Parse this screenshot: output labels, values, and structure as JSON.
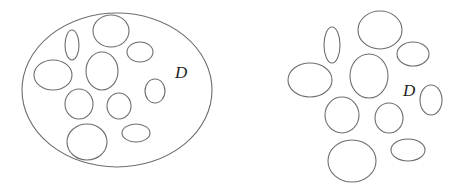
{
  "diagram": {
    "stroke_color": "#6e6e6e",
    "label_color": "#222222",
    "panels": [
      {
        "name": "left-panel",
        "description": "Domain D with holes, bounded by outer ellipse",
        "label": {
          "text": "D",
          "x": 175,
          "y": 78
        },
        "boundary": {
          "cx": 117,
          "cy": 90,
          "rx": 95,
          "ry": 77
        },
        "holes": [
          {
            "cx": 72,
            "cy": 45,
            "rx": 7,
            "ry": 15
          },
          {
            "cx": 111,
            "cy": 31,
            "rx": 18,
            "ry": 16
          },
          {
            "cx": 140,
            "cy": 52,
            "rx": 13,
            "ry": 10
          },
          {
            "cx": 53,
            "cy": 75,
            "rx": 19,
            "ry": 15
          },
          {
            "cx": 102,
            "cy": 71,
            "rx": 16,
            "ry": 19
          },
          {
            "cx": 155,
            "cy": 91,
            "rx": 10,
            "ry": 12
          },
          {
            "cx": 79,
            "cy": 104,
            "rx": 14,
            "ry": 15
          },
          {
            "cx": 119,
            "cy": 106,
            "rx": 12,
            "ry": 13
          },
          {
            "cx": 87,
            "cy": 142,
            "rx": 20,
            "ry": 18
          },
          {
            "cx": 136,
            "cy": 133,
            "rx": 14,
            "ry": 9
          }
        ]
      },
      {
        "name": "right-panel",
        "description": "Unbounded domain D exterior to a collection of ellipses",
        "label": {
          "text": "D",
          "x": 403,
          "y": 96
        },
        "boundary": null,
        "holes": [
          {
            "cx": 332,
            "cy": 45,
            "rx": 8,
            "ry": 18
          },
          {
            "cx": 380,
            "cy": 30,
            "rx": 22,
            "ry": 19
          },
          {
            "cx": 413,
            "cy": 54,
            "rx": 16,
            "ry": 12
          },
          {
            "cx": 310,
            "cy": 80,
            "rx": 22,
            "ry": 17
          },
          {
            "cx": 369,
            "cy": 76,
            "rx": 19,
            "ry": 22
          },
          {
            "cx": 431,
            "cy": 100,
            "rx": 11,
            "ry": 15
          },
          {
            "cx": 342,
            "cy": 115,
            "rx": 17,
            "ry": 18
          },
          {
            "cx": 389,
            "cy": 118,
            "rx": 14,
            "ry": 15
          },
          {
            "cx": 352,
            "cy": 161,
            "rx": 24,
            "ry": 21
          },
          {
            "cx": 408,
            "cy": 150,
            "rx": 17,
            "ry": 11
          }
        ]
      }
    ]
  }
}
